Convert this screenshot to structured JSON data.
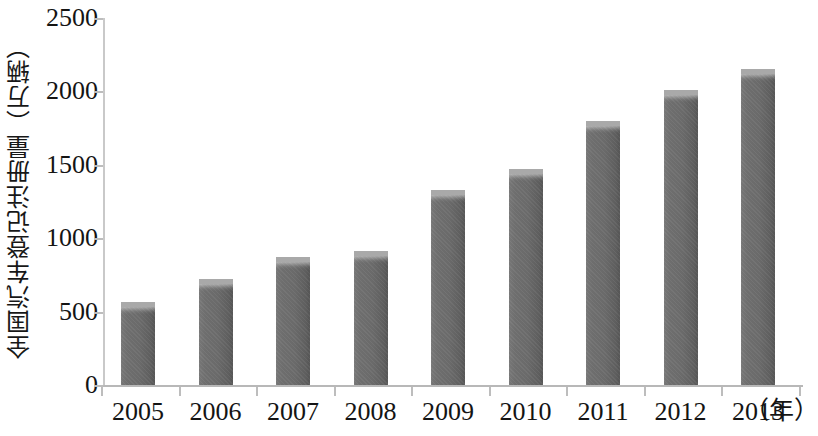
{
  "chart_data": {
    "type": "bar",
    "title": "",
    "subtitle": "",
    "xlabel": "（年）",
    "ylabel": "全国汽车登记注册量（万辆）",
    "categories": [
      "2005",
      "2006",
      "2007",
      "2008",
      "2009",
      "2010",
      "2011",
      "2012",
      "2013"
    ],
    "values": [
      565,
      720,
      870,
      910,
      1330,
      1470,
      1800,
      2010,
      2150
    ],
    "series": [
      {
        "name": "全国汽车登记注册量",
        "values": [
          565,
          720,
          870,
          910,
          1330,
          1470,
          1800,
          2010,
          2150
        ]
      }
    ],
    "ylim": [
      0,
      2500
    ],
    "y_ticks": [
      0,
      500,
      1000,
      1500,
      2000,
      2500
    ],
    "y_tick_labels": [
      "0",
      "500",
      "1000",
      "1500",
      "2000",
      "2500"
    ],
    "grid": false,
    "legend": false,
    "legend_position": "none",
    "bar_color": "#6a6a6a",
    "bar_top_color": "#a9a9a9",
    "axis_color": "#bdbdbd",
    "background_color": "#ffffff",
    "text_color": "#141414"
  },
  "axis": {
    "y_title": "全国汽车登记注册量（万辆）",
    "x_unit": "（年）",
    "y_tick_0": "0",
    "y_tick_1": "500",
    "y_tick_2": "1000",
    "y_tick_3": "1500",
    "y_tick_4": "2000",
    "y_tick_5": "2500"
  },
  "x_labels": {
    "l0": "2005",
    "l1": "2006",
    "l2": "2007",
    "l3": "2008",
    "l4": "2009",
    "l5": "2010",
    "l6": "2011",
    "l7": "2012",
    "l8": "2013"
  }
}
